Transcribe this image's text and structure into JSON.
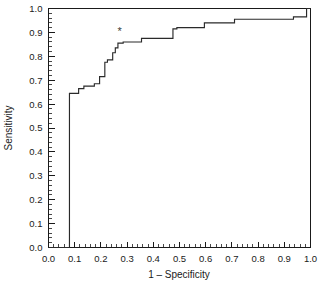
{
  "chart_data": {
    "type": "line",
    "title": "",
    "xlabel": "1 – Specificity",
    "ylabel": "Sensitivity",
    "xlim": [
      0.0,
      1.0
    ],
    "ylim": [
      0.0,
      1.0
    ],
    "grid": false,
    "legend": null,
    "xticks": [
      "0.0",
      "0.1",
      "0.2",
      "0.3",
      "0.4",
      "0.5",
      "0.6",
      "0.7",
      "0.8",
      "0.9",
      "1.0"
    ],
    "xtick_values": [
      0.0,
      0.1,
      0.2,
      0.3,
      0.4,
      0.5,
      0.6,
      0.7,
      0.8,
      0.9,
      1.0
    ],
    "yticks": [
      "0.0",
      "0.1",
      "0.2",
      "0.3",
      "0.4",
      "0.5",
      "0.6",
      "0.7",
      "0.8",
      "0.9",
      "1.0"
    ],
    "ytick_values": [
      0.0,
      0.1,
      0.2,
      0.3,
      0.4,
      0.5,
      0.6,
      0.7,
      0.8,
      0.9,
      1.0
    ],
    "minor_ticks_per_interval": 5,
    "series": [
      {
        "name": "ROC curve",
        "color": "#2a2a2a",
        "step": "post",
        "x": [
          0.0,
          0.08,
          0.08,
          0.115,
          0.115,
          0.135,
          0.135,
          0.175,
          0.175,
          0.195,
          0.195,
          0.215,
          0.215,
          0.225,
          0.225,
          0.245,
          0.245,
          0.255,
          0.255,
          0.265,
          0.265,
          0.285,
          0.285,
          0.355,
          0.355,
          0.475,
          0.475,
          0.49,
          0.49,
          0.595,
          0.595,
          0.71,
          0.71,
          0.935,
          0.935,
          0.985,
          0.985,
          1.0
        ],
        "y": [
          0.0,
          0.0,
          0.645,
          0.645,
          0.665,
          0.665,
          0.675,
          0.675,
          0.685,
          0.685,
          0.715,
          0.715,
          0.775,
          0.775,
          0.785,
          0.785,
          0.815,
          0.815,
          0.835,
          0.835,
          0.855,
          0.855,
          0.86,
          0.86,
          0.875,
          0.875,
          0.915,
          0.915,
          0.92,
          0.92,
          0.94,
          0.94,
          0.955,
          0.955,
          0.965,
          0.965,
          1.0,
          1.0
        ]
      }
    ],
    "annotations": [
      {
        "label": "*",
        "name": "optimal-cutpoint-marker",
        "x": 0.272,
        "y": 0.905
      }
    ]
  },
  "axes": {
    "x_title": "1 – Specificity",
    "y_title": "Sensitivity"
  }
}
